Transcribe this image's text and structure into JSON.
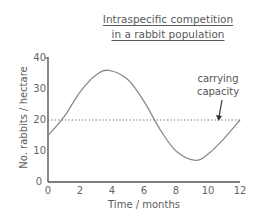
{
  "chart_data": {
    "type": "line",
    "title": "Intraspecific competition in a rabbit population",
    "title_lines": [
      "Intraspecific competition",
      "in a rabbit population"
    ],
    "xlabel": "Time / months",
    "ylabel": "No. rabbits / hectare",
    "xlim": [
      0,
      12
    ],
    "ylim": [
      0,
      40
    ],
    "x_ticks": [
      "0",
      "2",
      "4",
      "6",
      "8",
      "10",
      "12"
    ],
    "y_ticks": [
      "0",
      "10",
      "20",
      "30",
      "40"
    ],
    "grid": false,
    "legend": null,
    "series": [
      {
        "name": "Rabbit population",
        "x": [
          0,
          1,
          2,
          3,
          3.8,
          5,
          6,
          7,
          8,
          9.2,
          10,
          11,
          12
        ],
        "values": [
          15,
          21,
          29,
          34.5,
          36,
          33,
          26,
          17,
          10,
          7,
          9,
          14,
          20
        ]
      },
      {
        "name": "Carrying capacity",
        "style": "dotted",
        "x": [
          0,
          12
        ],
        "values": [
          20,
          20
        ]
      }
    ],
    "annotations": [
      {
        "text": "carrying capacity",
        "lines": [
          "carrying",
          "capacity"
        ],
        "arrow_to": {
          "x": 9,
          "y": 20
        }
      }
    ]
  },
  "colors": {
    "curve": "#8a8a8a",
    "axis": "#555555",
    "dotted_line": "#666666",
    "text": "#5a5a5a"
  }
}
